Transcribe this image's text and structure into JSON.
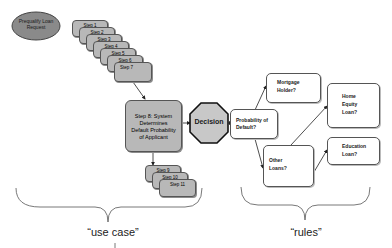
{
  "start": {
    "label": "Prequalify Loan Request"
  },
  "use_case_steps": [
    {
      "label": "Step 1"
    },
    {
      "label": "Step 2"
    },
    {
      "label": "Step 3"
    },
    {
      "label": "Step 4"
    },
    {
      "label": "Step 5"
    },
    {
      "label": "Step 6"
    },
    {
      "label": "Step 7"
    }
  ],
  "system_step": {
    "label": "Step 8: System Determines Default Probability of Applicant"
  },
  "post_steps": [
    {
      "label": "Step 9"
    },
    {
      "label": "Step 10"
    },
    {
      "label": "Step 11"
    }
  ],
  "decision": {
    "label": "Decision"
  },
  "rules": {
    "probability": "Probability of Default?",
    "mortgage": "Mortgage Holder?",
    "home_equity": "Home Equity Loan?",
    "other_loans": "Other Loans?",
    "education": "Education Loan?"
  },
  "braces": {
    "left_label": "“use case”",
    "right_label": "“rules”"
  },
  "colors": {
    "step_fill": "#b8b8b8",
    "oval_fill": "#8a8a8a",
    "decision_fill": "#c8c8c8",
    "rule_fill": "#ffffff",
    "line": "#333333"
  }
}
